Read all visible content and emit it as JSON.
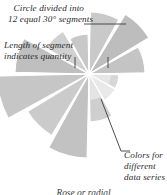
{
  "diagram": {
    "kind": "rose-chart-annotated-diagram",
    "caption": "Rose or radial",
    "annotations": [
      {
        "id": "segments",
        "line1": "Circle divided into",
        "line2": "12 equal 30° segments"
      },
      {
        "id": "length",
        "line1": "Length of segment",
        "line2": "indicates quantity"
      },
      {
        "id": "colors",
        "line1": "Colors for",
        "line2": "different",
        "line3": "data series"
      }
    ]
  },
  "chart_data": {
    "type": "pie",
    "subtype": "rose-polar-area",
    "title": "",
    "subtitle": "",
    "xlabel": "",
    "ylabel": "",
    "segment_count": 12,
    "segment_angle_deg": 30,
    "center": {
      "x": 89,
      "y": 74
    },
    "grid": false,
    "legend": false,
    "rlim": [
      0,
      82
    ],
    "categories": [
      "0°–30°",
      "30°–60°",
      "60°–90°",
      "90°–120°",
      "120°–150°",
      "150°–180°",
      "180°–210°",
      "210°–240°",
      "240°–270°",
      "270°–300°",
      "300°–330°",
      "330°–360°"
    ],
    "values": [
      62,
      70,
      56,
      30,
      28,
      48,
      84,
      72,
      92,
      74,
      50,
      40
    ],
    "colors": [
      "#c9c9c9",
      "#bdbdbd",
      "#c4c4c4",
      "#d6d6d6",
      "#e0e0e0",
      "#cfcfcf",
      "#c2c2c2",
      "#cbcbcb",
      "#c6c6c6",
      "#bfbfbf",
      "#d0d0d0",
      "#c8c8c8"
    ],
    "gap_color": "#ffffff",
    "leader_line_color": "#3a3a3a",
    "background": "#ffffff"
  },
  "style": {
    "accent": "#c6c6c6",
    "text_color": "#2b2b2b",
    "leader_color": "#3a3a3a"
  }
}
